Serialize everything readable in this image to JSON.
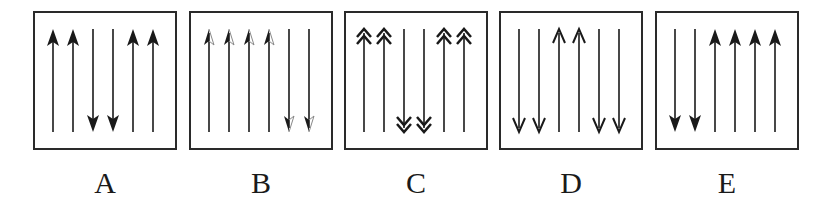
{
  "figure": {
    "colors": {
      "stroke": "#1a1a1a",
      "box": "#2a2a2a",
      "light": "#ffffff"
    },
    "panels": [
      {
        "label": "A",
        "left": 33,
        "arrowhead": "solid",
        "arrows": [
          "up",
          "up",
          "down",
          "down",
          "up",
          "up"
        ]
      },
      {
        "label": "B",
        "left": 189,
        "arrowhead": "half",
        "arrows": [
          "up",
          "up",
          "up",
          "up",
          "down",
          "down"
        ]
      },
      {
        "label": "C",
        "left": 344,
        "arrowhead": "double-chevron",
        "arrows": [
          "up",
          "up",
          "down",
          "down",
          "up",
          "up"
        ]
      },
      {
        "label": "D",
        "left": 499,
        "arrowhead": "open",
        "arrows": [
          "down",
          "down",
          "up",
          "up",
          "down",
          "down"
        ]
      },
      {
        "label": "E",
        "left": 655,
        "arrowhead": "solid",
        "arrows": [
          "down",
          "down",
          "up",
          "up",
          "up",
          "up"
        ]
      }
    ]
  }
}
